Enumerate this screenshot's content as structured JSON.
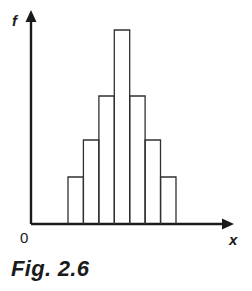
{
  "figure": {
    "caption": "Fig. 2.6",
    "origin_label": "0",
    "y_axis_label": "f",
    "x_axis_label": "x",
    "ink_color": "#1a1a1a",
    "bar_stroke_color": "#303030",
    "background_color": "#ffffff"
  },
  "chart_data": {
    "type": "bar",
    "title": "Fig. 2.6",
    "xlabel": "x",
    "ylabel": "f",
    "categories": [
      "1",
      "2",
      "3",
      "4",
      "5",
      "6",
      "7"
    ],
    "values": [
      47,
      84,
      128,
      194,
      128,
      84,
      47
    ],
    "bar_tops_px": [
      177,
      140,
      96,
      30,
      96,
      140,
      177
    ],
    "bar_left_edges_px": [
      68.0,
      83.4,
      98.9,
      114.3,
      129.7,
      145.1,
      160.6
    ],
    "bar_width_px": 15.4,
    "baseline_y_px": 224,
    "axis_origin_px": [
      31,
      224
    ],
    "y_axis_tip_px": [
      31,
      11
    ],
    "x_axis_tip_px": [
      234,
      224
    ],
    "xlim": [
      31,
      234
    ],
    "ylim": [
      0,
      200
    ],
    "grid": false,
    "legend": false,
    "annotations": [
      "0",
      "f",
      "x"
    ]
  }
}
